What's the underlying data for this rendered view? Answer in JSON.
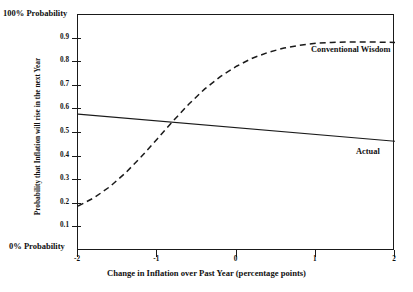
{
  "chart_data": {
    "type": "line",
    "title": "",
    "xlabel": "Change in Inflation over Past Year (percentage points)",
    "ylabel": "Probability that Inflation will rise in the next Year",
    "xlim": [
      -2,
      2
    ],
    "ylim": [
      0,
      1
    ],
    "grid": false,
    "legend_position": "inline-annotations",
    "xticks": [
      -2,
      -1,
      0,
      1,
      2
    ],
    "xticklabels": [
      "-2",
      "-1",
      "0",
      "1",
      "2"
    ],
    "yticks": [
      0.1,
      0.2,
      0.3,
      0.4,
      0.5,
      0.6,
      0.7,
      0.8,
      0.9
    ],
    "yticklabels": [
      "0.1",
      "0.2",
      "0.3",
      "0.4",
      "0.5",
      "0.6",
      "0.7",
      "0.8",
      "0.9"
    ],
    "axis_end_labels": {
      "y_top": "100% Probability",
      "y_bottom": "0% Probability"
    },
    "series": [
      {
        "name": "Conventional Wisdom",
        "style": "dashed",
        "color": "#1a1a1a",
        "x": [
          -2.0,
          -1.8,
          -1.6,
          -1.4,
          -1.2,
          -1.0,
          -0.8,
          -0.6,
          -0.4,
          -0.2,
          0.0,
          0.2,
          0.4,
          0.6,
          0.8,
          1.0,
          1.2,
          1.4,
          1.6,
          1.8,
          2.0
        ],
        "values": [
          0.19,
          0.225,
          0.272,
          0.331,
          0.4,
          0.475,
          0.551,
          0.623,
          0.687,
          0.74,
          0.783,
          0.817,
          0.842,
          0.86,
          0.872,
          0.88,
          0.884,
          0.886,
          0.886,
          0.885,
          0.884
        ]
      },
      {
        "name": "Actual",
        "style": "solid",
        "color": "#1a1a1a",
        "x": [
          -2.0,
          2.0
        ],
        "values": [
          0.58,
          0.465
        ]
      }
    ],
    "annotations": [
      {
        "text": "Conventional Wisdom",
        "x": 1.0,
        "y": 0.875
      },
      {
        "text": "Actual",
        "x": 1.55,
        "y": 0.495
      }
    ]
  },
  "axis": {
    "y_top_label": "100% Probability",
    "y_bottom_label": "0% Probability",
    "y_title": "Probability that Inflation will rise in the next Year",
    "x_title": "Change in Inflation over Past Year (percentage points)",
    "y_ticks": [
      "0.9",
      "0.8",
      "0.7",
      "0.6",
      "0.5",
      "0.4",
      "0.3",
      "0.2",
      "0.1"
    ],
    "x_ticks": [
      "-2",
      "-1",
      "0",
      "1",
      "2"
    ]
  },
  "labels": {
    "conventional_wisdom": "Conventional Wisdom",
    "actual": "Actual"
  },
  "colors": {
    "line": "#1a1a1a",
    "background": "#ffffff"
  }
}
